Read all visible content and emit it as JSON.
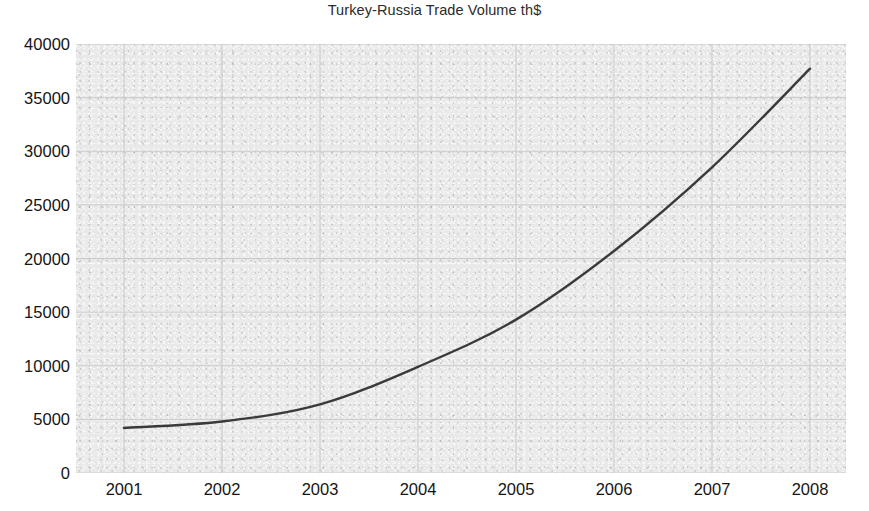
{
  "chart_data": {
    "type": "line",
    "title": "Turkey-Russia Trade Volume th$",
    "xlabel": "",
    "ylabel": "",
    "categories": [
      "2001",
      "2002",
      "2003",
      "2004",
      "2005",
      "2006",
      "2007",
      "2008"
    ],
    "x": [
      2001,
      2002,
      2003,
      2004,
      2005,
      2006,
      2007,
      2008
    ],
    "series": [
      {
        "name": "Turkey-Russia Trade Volume",
        "values": [
          4200,
          4800,
          6400,
          9900,
          14300,
          20700,
          28500,
          37700
        ]
      }
    ],
    "ylim": [
      0,
      40000
    ],
    "ytick_values": [
      0,
      5000,
      10000,
      15000,
      20000,
      25000,
      30000,
      35000,
      40000
    ],
    "ytick_labels": [
      "0",
      "5000",
      "10000",
      "15000",
      "20000",
      "25000",
      "30000",
      "35000",
      "40000"
    ],
    "xtick_labels": [
      "2001",
      "2002",
      "2003",
      "2004",
      "2005",
      "2006",
      "2007",
      "2008"
    ],
    "grid": true,
    "grid_axes": "both",
    "legend": false,
    "legend_position": "none",
    "line_color": "#3a3a3a",
    "grid_color": "#c9c9c9",
    "plot_background": "#e9e9e9",
    "text_color": "#151515"
  }
}
